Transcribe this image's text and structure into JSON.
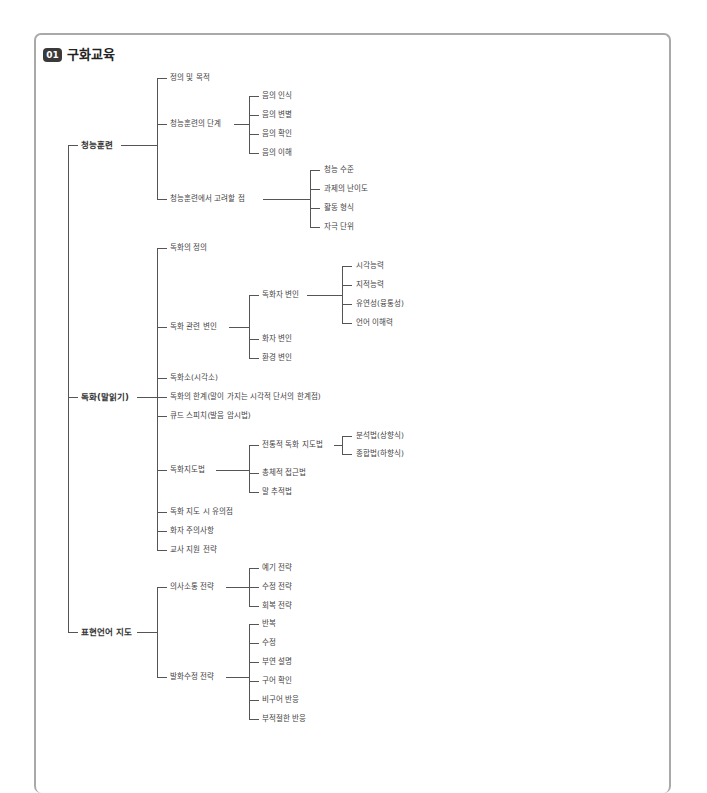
{
  "section": {
    "number": "01",
    "title": "구화교육"
  },
  "tree": {
    "auditory_training": {
      "label": "청능훈련",
      "children": {
        "definition": "정의 및 목적",
        "stages": {
          "label": "청능훈련의 단계",
          "children": [
            "음의 인식",
            "음의 변별",
            "음의 확인",
            "음의 이해"
          ]
        },
        "considerations": {
          "label": "청능훈련에서 고려할 점",
          "children": [
            "청능 수준",
            "과제의 난이도",
            "활동 형식",
            "자극 단위"
          ]
        }
      }
    },
    "speechreading": {
      "label": "독화(말읽기)",
      "children": {
        "definition": "독화의 정의",
        "variables": {
          "label": "독화 관련 변인",
          "reader": {
            "label": "독화자 변인",
            "children": [
              "시각능력",
              "지적능력",
              "유연성(융통성)",
              "언어 이해력"
            ]
          },
          "speaker": "화자 변인",
          "environment": "환경 변인"
        },
        "visemes": "독화소(시각소)",
        "limits": "독화의 한계(말이 가지는 시각적 단서의 한계점)",
        "cued_speech": "큐드 스피치(발음 암시법)",
        "methods": {
          "label": "독화지도법",
          "traditional": {
            "label": "전통적 독화 지도법",
            "children": [
              "분석법(상향식)",
              "종합법(하향식)"
            ]
          },
          "holistic": "총체적 접근법",
          "tracking": "말 추적법"
        },
        "cautions": "독화 지도 시 유의점",
        "speaker_notes": "화자 주의사항",
        "teacher_support": "교사 지원 전략"
      }
    },
    "expressive_language": {
      "label": "표현언어 지도",
      "children": {
        "communication": {
          "label": "의사소통 전략",
          "children": [
            "예기 전략",
            "수정 전략",
            "회복 전략"
          ]
        },
        "repair": {
          "label": "발화수정 전략",
          "children": [
            "반복",
            "수정",
            "부연 설명",
            "구어 확인",
            "비구어 반응",
            "부적절한 반응"
          ]
        }
      }
    }
  }
}
